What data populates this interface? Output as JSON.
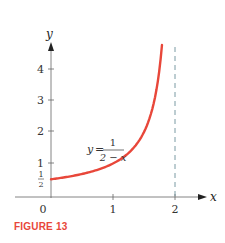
{
  "figure": {
    "caption": "FIGURE 13",
    "caption_color": "#e8473a"
  },
  "chart_data": {
    "type": "line",
    "title": "",
    "xlabel": "x",
    "ylabel": "y",
    "xlim": [
      0,
      2.3
    ],
    "ylim": [
      0,
      4.7
    ],
    "grid": false,
    "x_ticks": [
      "0",
      "1",
      "2"
    ],
    "y_ticks": [
      "1/2",
      "1",
      "2",
      "3",
      "4"
    ],
    "series": [
      {
        "name": "y = 1/(2 - x)",
        "color": "#e8473a",
        "x": [
          0,
          0.25,
          0.5,
          0.75,
          1.0,
          1.25,
          1.5,
          1.6,
          1.7,
          1.79
        ],
        "values": [
          0.5,
          0.571,
          0.667,
          0.8,
          1.0,
          1.333,
          2.0,
          2.5,
          3.333,
          4.76
        ]
      }
    ],
    "annotations": [
      {
        "type": "label",
        "text_lhs": "y =",
        "numerator": "1",
        "denominator": "2 − x",
        "x": 0.75,
        "y": 1.3
      },
      {
        "type": "asymptote",
        "orientation": "vertical",
        "x": 2,
        "style": "dashed",
        "color": "#6b8f99"
      }
    ]
  }
}
